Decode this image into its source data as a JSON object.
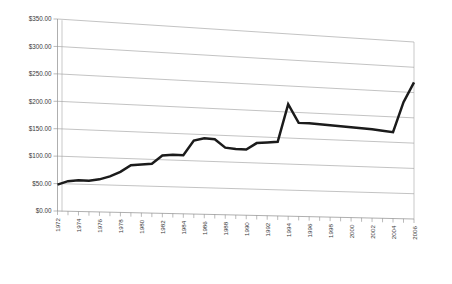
{
  "chart_data": {
    "type": "line",
    "title": "",
    "subtitle": "",
    "xlabel": "",
    "ylabel": "",
    "ylim": [
      0,
      350
    ],
    "ytick_values": [
      0,
      50,
      100,
      150,
      200,
      250,
      300,
      350
    ],
    "ytick_labels": [
      "$0.00",
      "$50.00",
      "$100.00",
      "$150.00",
      "$200.00",
      "$250.00",
      "$300.00",
      "$350.00"
    ],
    "grid": true,
    "legend": false,
    "legend_position": "none",
    "perspective_3d": true,
    "value_prefix": "$",
    "x_tick_interval_years": 1,
    "x_label_interval_years": 2,
    "xlim": [
      1972,
      2006
    ],
    "x": [
      1972,
      1973,
      1974,
      1975,
      1976,
      1977,
      1978,
      1979,
      1980,
      1981,
      1982,
      1983,
      1984,
      1985,
      1986,
      1987,
      1988,
      1989,
      1990,
      1991,
      1992,
      1993,
      1994,
      1995,
      1996,
      1997,
      1998,
      1999,
      2000,
      2001,
      2002,
      2003,
      2004,
      2005,
      2006
    ],
    "xtick_labels": [
      "1972",
      "1974",
      "1976",
      "1978",
      "1980",
      "1982",
      "1984",
      "1986",
      "1988",
      "1990",
      "1992",
      "1994",
      "1996",
      "1998",
      "2000",
      "2002",
      "2004",
      "2006"
    ],
    "series": [
      {
        "name": "Value",
        "color": "#1b1b1b",
        "values": [
          48,
          55,
          57,
          57,
          60,
          66,
          75,
          88,
          90,
          92,
          108,
          110,
          110,
          138,
          143,
          142,
          127,
          125,
          125,
          138,
          140,
          142,
          215,
          180,
          180,
          179,
          178,
          177,
          176,
          175,
          174,
          172,
          170,
          230,
          270
        ]
      }
    ]
  }
}
